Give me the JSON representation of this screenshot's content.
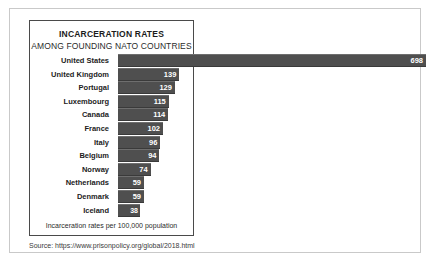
{
  "figure": {
    "source_label": "Source: https://www.prisonpolicy.org/global/2018.html"
  },
  "chart_data": {
    "type": "bar",
    "orientation": "horizontal",
    "title": "INCARCERATION RATES",
    "subtitle": "AMONG FOUNDING NATO COUNTRIES",
    "xlabel": "Incarceration rates per 100,000 population",
    "ylabel": "",
    "xlim": [
      0,
      698
    ],
    "grid": false,
    "legend": null,
    "bar_color": "#4f4f4f",
    "value_label_color": "#ffffff",
    "categories": [
      "United States",
      "United Kingdom",
      "Portugal",
      "Luxembourg",
      "Canada",
      "France",
      "Italy",
      "Belgium",
      "Norway",
      "Netherlands",
      "Denmark",
      "Iceland"
    ],
    "values": [
      698,
      139,
      129,
      115,
      114,
      102,
      96,
      94,
      74,
      59,
      59,
      38
    ]
  }
}
